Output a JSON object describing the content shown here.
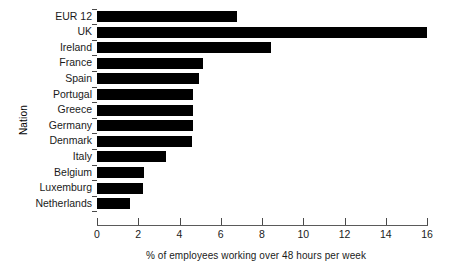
{
  "chart_data": {
    "type": "bar",
    "orientation": "horizontal",
    "title": "",
    "xlabel": "% of employees working over 48 hours per week",
    "ylabel": "Nation",
    "categories": [
      "EUR 12",
      "UK",
      "Ireland",
      "France",
      "Spain",
      "Portugal",
      "Greece",
      "Germany",
      "Denmark",
      "Italy",
      "Belgium",
      "Luxemburg",
      "Netherlands"
    ],
    "values": [
      6.8,
      16.0,
      8.45,
      5.15,
      4.95,
      4.65,
      4.65,
      4.65,
      4.6,
      3.35,
      2.3,
      2.25,
      1.6
    ],
    "xlim": [
      0,
      16
    ],
    "xticks": [
      0,
      2,
      4,
      6,
      8,
      10,
      12,
      14,
      16
    ],
    "xtick_labels": [
      "0",
      "2",
      "4",
      "6",
      "8",
      "10",
      "12",
      "14",
      "16"
    ],
    "grid": false,
    "legend": false,
    "bar_color": "#000000",
    "axis_color": "#4a4a4a",
    "background_color": "#ffffff"
  }
}
